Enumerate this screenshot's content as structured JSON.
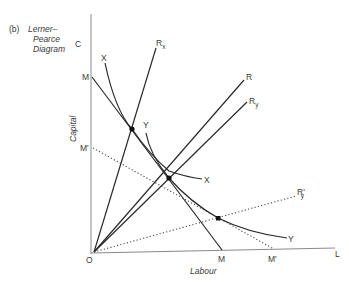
{
  "figure": {
    "panel_label": "(b)",
    "title_line1": "Lerner–",
    "title_line2": "Pearce",
    "title_line3": "Diagram"
  },
  "axes": {
    "y_axis_top_label": "C",
    "y_axis_title": "Capital",
    "x_axis_end_label": "L",
    "x_axis_title": "Labour",
    "origin_label": "O"
  },
  "rays": {
    "rx": {
      "main": "R",
      "sub": "x"
    },
    "r": {
      "main": "R"
    },
    "ry": {
      "main": "R",
      "sub": "y"
    },
    "ry_prime": {
      "main": "R'",
      "sub": "y"
    }
  },
  "curves": {
    "x_isoquant_start": "X",
    "x_isoquant_end": "X",
    "y_isoquant_start": "Y",
    "y_isoquant_end": "Y"
  },
  "isocost": {
    "m_top": "M",
    "m_bottom": "M",
    "m_prime_top": "M'",
    "m_prime_bottom": "M'"
  },
  "colors": {
    "line": "#2a2a2a",
    "axis": "#8a8a8a",
    "text": "#3a3a3a",
    "background": "#ffffff"
  }
}
